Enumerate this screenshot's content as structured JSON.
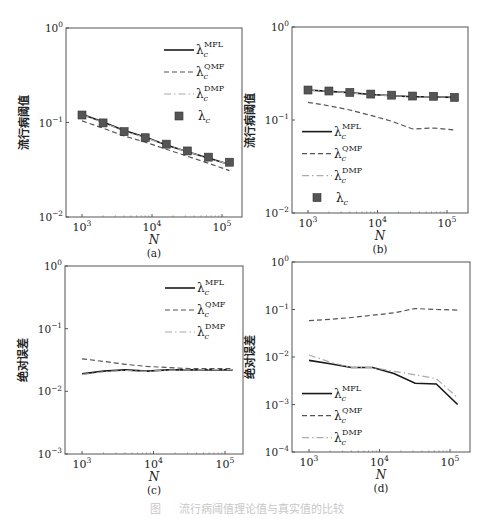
{
  "figure": {
    "caption": "图 　 流行病阈值理论值与真实值的比较"
  },
  "legend_labels": {
    "MFL": "MFL",
    "QMF": "QMF",
    "DMP": "DMP",
    "base": "λ",
    "sub": "c"
  },
  "chart_data": [
    {
      "id": "a",
      "panel_label": "(a)",
      "type": "line",
      "xlabel": "N",
      "ylabel": "流行病阈值",
      "xscale": "log",
      "yscale": "log",
      "xlim": [
        700,
        160000
      ],
      "ylim": [
        0.01,
        1
      ],
      "x_ticks": [
        "10^3",
        "10^4",
        "10^5"
      ],
      "y_ticks": [
        "10^-2",
        "10^-1",
        "10^0"
      ],
      "legend_position": "upper right",
      "x": [
        1000,
        2000,
        4000,
        8000,
        16000,
        32000,
        64000,
        128000
      ],
      "series": [
        {
          "name": "λc^MFL",
          "style": "solid",
          "values": [
            0.122,
            0.101,
            0.082,
            0.07,
            0.058,
            0.049,
            0.042,
            0.036
          ]
        },
        {
          "name": "λc^QMF",
          "style": "dashed",
          "values": [
            0.104,
            0.087,
            0.072,
            0.062,
            0.052,
            0.044,
            0.037,
            0.031
          ]
        },
        {
          "name": "λc^DMP",
          "style": "dashdot",
          "values": [
            0.121,
            0.1,
            0.081,
            0.069,
            0.058,
            0.049,
            0.042,
            0.036
          ]
        },
        {
          "name": "λc",
          "style": "marker-square",
          "values": [
            0.12,
            0.099,
            0.08,
            0.069,
            0.059,
            0.05,
            0.043,
            0.038
          ]
        }
      ]
    },
    {
      "id": "b",
      "panel_label": "(b)",
      "type": "line",
      "xlabel": "N",
      "ylabel": "流行病阈值",
      "xscale": "log",
      "yscale": "log",
      "xlim": [
        700,
        160000
      ],
      "ylim": [
        0.01,
        1
      ],
      "x_ticks": [
        "10^3",
        "10^4",
        "10^5"
      ],
      "y_ticks": [
        "10^-2",
        "10^-1",
        "10^0"
      ],
      "legend_position": "lower left",
      "x": [
        1000,
        2000,
        4000,
        8000,
        16000,
        32000,
        64000,
        128000
      ],
      "series": [
        {
          "name": "λc^MFL",
          "style": "solid",
          "values": [
            0.21,
            0.203,
            0.197,
            0.188,
            0.183,
            0.178,
            0.177,
            0.175
          ]
        },
        {
          "name": "λc^QMF",
          "style": "dashed",
          "values": [
            0.155,
            0.142,
            0.128,
            0.112,
            0.097,
            0.08,
            0.082,
            0.078
          ]
        },
        {
          "name": "λc^DMP",
          "style": "dashdot",
          "values": [
            0.21,
            0.203,
            0.196,
            0.187,
            0.183,
            0.178,
            0.177,
            0.175
          ]
        },
        {
          "name": "λc",
          "style": "marker-square",
          "values": [
            0.21,
            0.205,
            0.198,
            0.19,
            0.185,
            0.181,
            0.18,
            0.175
          ]
        }
      ]
    },
    {
      "id": "c",
      "panel_label": "(c)",
      "type": "line",
      "xlabel": "N",
      "ylabel": "绝对误差",
      "xscale": "log",
      "yscale": "log",
      "xlim": [
        700,
        160000
      ],
      "ylim": [
        0.001,
        1
      ],
      "x_ticks": [
        "10^3",
        "10^4",
        "10^5"
      ],
      "y_ticks": [
        "10^-3",
        "10^-2",
        "10^-1",
        "10^0"
      ],
      "legend_position": "upper right",
      "x": [
        1000,
        2000,
        4000,
        8000,
        16000,
        32000,
        64000,
        128000
      ],
      "series": [
        {
          "name": "λc^MFL",
          "style": "solid",
          "values": [
            0.019,
            0.021,
            0.022,
            0.021,
            0.022,
            0.022,
            0.022,
            0.022
          ]
        },
        {
          "name": "λc^QMF",
          "style": "dashed",
          "values": [
            0.033,
            0.03,
            0.027,
            0.025,
            0.024,
            0.023,
            0.023,
            0.023
          ]
        },
        {
          "name": "λc^DMP",
          "style": "dashdot",
          "values": [
            0.0185,
            0.0205,
            0.0215,
            0.0208,
            0.0218,
            0.022,
            0.0222,
            0.0223
          ]
        }
      ]
    },
    {
      "id": "d",
      "panel_label": "(d)",
      "type": "line",
      "xlabel": "N",
      "ylabel": "绝对误差",
      "xscale": "log",
      "yscale": "log",
      "xlim": [
        700,
        160000
      ],
      "ylim": [
        0.0001,
        1
      ],
      "x_ticks": [
        "10^3",
        "10^4",
        "10^5"
      ],
      "y_ticks": [
        "10^-4",
        "10^-3",
        "10^-2",
        "10^-1",
        "10^0"
      ],
      "legend_position": "lower left",
      "x": [
        1000,
        2000,
        4000,
        8000,
        16000,
        32000,
        64000,
        128000
      ],
      "series": [
        {
          "name": "λc^MFL",
          "style": "solid",
          "values": [
            0.0085,
            0.0072,
            0.006,
            0.006,
            0.0045,
            0.0028,
            0.0027,
            0.001
          ]
        },
        {
          "name": "λc^QMF",
          "style": "dashed",
          "values": [
            0.058,
            0.062,
            0.068,
            0.076,
            0.085,
            0.105,
            0.1,
            0.097
          ]
        },
        {
          "name": "λc^DMP",
          "style": "dashdot",
          "values": [
            0.011,
            0.0078,
            0.006,
            0.006,
            0.005,
            0.0042,
            0.0035,
            0.0014
          ]
        }
      ]
    }
  ]
}
